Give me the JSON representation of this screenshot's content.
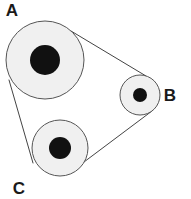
{
  "figure": {
    "background_color": "#ffffff",
    "width": 191,
    "height": 199
  },
  "style": {
    "rim_fill": "#f0f0f0",
    "rim_stroke": "#555555",
    "hub_fill": "#111111",
    "belt_stroke": "#444444",
    "label_color": "#1a1a1a"
  },
  "chart_data": {
    "type": "diagram",
    "pulleys": [
      {
        "id": "A",
        "label": "A",
        "cx": 45,
        "cy": 60,
        "radius": 39,
        "hub_radius": 15,
        "label_x": 12,
        "label_y": 16
      },
      {
        "id": "B",
        "label": "B",
        "cx": 140,
        "cy": 95,
        "radius": 20,
        "hub_radius": 7,
        "label_x": 170,
        "label_y": 101
      },
      {
        "id": "C",
        "label": "C",
        "cx": 60,
        "cy": 148,
        "radius": 28,
        "hub_radius": 11,
        "label_x": 19,
        "label_y": 194
      }
    ],
    "belt_segments": [
      {
        "from": "A",
        "to": "B",
        "x1": 71,
        "y1": 31,
        "x2": 146,
        "y2": 76
      },
      {
        "from": "B",
        "to": "C",
        "x1": 152,
        "y1": 111,
        "x2": 80,
        "y2": 165
      },
      {
        "from": "C",
        "to": "A",
        "x1": 33,
        "y1": 163,
        "x2": 9,
        "y2": 80
      }
    ]
  },
  "labels": {
    "a": "A",
    "b": "B",
    "c": "C"
  }
}
